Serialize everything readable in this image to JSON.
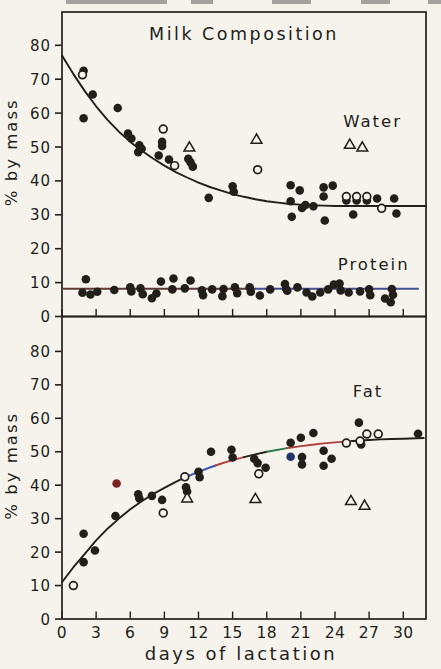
{
  "figure": {
    "title": "Milk Composition",
    "xlabel": "days of lactation",
    "ylabel": "% by mass",
    "colors": {
      "paper": "#f6f3ec",
      "ink": "#221f1b",
      "scan_artifact": "#a3a19d",
      "protein_line_left": "#5d3a35",
      "protein_line_right": "#45508e",
      "fat_fringe_blue": "#3a55b0",
      "fat_fringe_red": "#b04040",
      "fat_fringe_green": "#2e7d4f",
      "special_point_red": "#7a2423",
      "special_point_blue": "#22356e"
    }
  },
  "chart_data": [
    {
      "id": "composition-panel",
      "type": "scatter",
      "title": "Milk Composition",
      "title_pos": [
        16.0,
        81.5
      ],
      "ylabel": "% by mass",
      "xlabel": "",
      "xlim": [
        0,
        32
      ],
      "ylim": [
        0,
        89.5
      ],
      "yticks": [
        0,
        10,
        20,
        30,
        40,
        50,
        60,
        70,
        80
      ],
      "xticks": [
        0,
        3,
        6,
        9,
        12,
        15,
        18,
        21,
        24,
        27,
        30
      ],
      "show_xtick_labels": false,
      "grid": false,
      "legend": "in-plot text labels",
      "series": [
        {
          "name": "Water",
          "label_pos": [
            27.3,
            56.0
          ],
          "marker_filled_circle": [
            [
              1.9,
              72.5
            ],
            [
              2.7,
              65.5
            ],
            [
              1.9,
              58.5
            ],
            [
              4.9,
              61.5
            ],
            [
              5.8,
              54.0
            ],
            [
              6.1,
              52.5
            ],
            [
              6.8,
              50.5
            ],
            [
              6.7,
              48.5
            ],
            [
              7.0,
              49.5
            ],
            [
              8.8,
              51.5
            ],
            [
              8.8,
              50.3
            ],
            [
              8.5,
              47.5
            ],
            [
              9.4,
              46.3
            ],
            [
              11.1,
              46.5
            ],
            [
              11.3,
              45.5
            ],
            [
              11.5,
              44.2
            ],
            [
              12.9,
              35.0
            ],
            [
              15.0,
              38.4
            ],
            [
              15.1,
              36.8
            ],
            [
              20.1,
              38.7
            ],
            [
              20.9,
              37.2
            ],
            [
              20.1,
              34.0
            ],
            [
              20.2,
              29.4
            ],
            [
              21.1,
              32.0
            ],
            [
              21.4,
              32.9
            ],
            [
              22.1,
              32.5
            ],
            [
              23.0,
              38.1
            ],
            [
              23.8,
              38.6
            ],
            [
              23.0,
              35.4
            ],
            [
              23.1,
              28.3
            ],
            [
              25.0,
              34.2
            ],
            [
              25.9,
              34.2
            ],
            [
              26.8,
              34.2
            ],
            [
              25.6,
              30.1
            ],
            [
              27.7,
              34.8
            ],
            [
              29.2,
              34.8
            ],
            [
              29.4,
              30.4
            ]
          ],
          "marker_open_circle": [
            [
              1.8,
              71.3
            ],
            [
              8.9,
              55.3
            ],
            [
              9.9,
              44.5
            ],
            [
              17.2,
              43.3
            ],
            [
              25.0,
              35.4
            ],
            [
              25.9,
              35.4
            ],
            [
              26.8,
              35.4
            ],
            [
              28.1,
              31.9
            ]
          ],
          "marker_open_triangle": [
            [
              11.2,
              50.0
            ],
            [
              17.1,
              52.3
            ],
            [
              25.3,
              50.8
            ],
            [
              26.4,
              50.0
            ]
          ],
          "trend": [
            [
              0,
              77
            ],
            [
              1,
              71.5
            ],
            [
              2,
              66.5
            ],
            [
              3,
              62
            ],
            [
              4,
              58
            ],
            [
              5,
              54.5
            ],
            [
              6,
              51.5
            ],
            [
              7,
              49
            ],
            [
              8,
              46.6
            ],
            [
              9,
              44.5
            ],
            [
              10,
              42.6
            ],
            [
              11,
              41
            ],
            [
              12,
              39.5
            ],
            [
              13,
              38.2
            ],
            [
              14,
              37.1
            ],
            [
              15,
              36.1
            ],
            [
              16,
              35.3
            ],
            [
              17,
              34.6
            ],
            [
              18,
              34.0
            ],
            [
              19,
              33.6
            ],
            [
              20,
              33.2
            ],
            [
              21,
              33.0
            ],
            [
              22,
              32.8
            ],
            [
              23,
              32.7
            ],
            [
              24,
              32.6
            ],
            [
              26,
              32.6
            ],
            [
              28,
              32.6
            ],
            [
              30,
              32.6
            ],
            [
              32,
              32.6
            ]
          ],
          "trend_segments": [
            {
              "from": 0,
              "to": 32,
              "color": "ink"
            }
          ]
        },
        {
          "name": "Protein",
          "label_pos": [
            27.4,
            13.6
          ],
          "marker_filled_circle": [
            [
              2.1,
              11.0
            ],
            [
              1.8,
              7.0
            ],
            [
              2.5,
              6.5
            ],
            [
              3.1,
              7.3
            ],
            [
              4.6,
              7.8
            ],
            [
              6.0,
              8.6
            ],
            [
              6.1,
              7.4
            ],
            [
              6.9,
              8.3
            ],
            [
              7.1,
              6.6
            ],
            [
              7.9,
              5.4
            ],
            [
              8.3,
              6.8
            ],
            [
              8.7,
              10.3
            ],
            [
              9.7,
              8.0
            ],
            [
              9.8,
              11.2
            ],
            [
              10.8,
              8.3
            ],
            [
              11.3,
              10.6
            ],
            [
              12.3,
              7.7
            ],
            [
              12.4,
              6.3
            ],
            [
              13.2,
              8.0
            ],
            [
              14.1,
              6.0
            ],
            [
              14.2,
              8.1
            ],
            [
              15.2,
              8.6
            ],
            [
              15.4,
              6.9
            ],
            [
              16.5,
              8.6
            ],
            [
              16.6,
              7.3
            ],
            [
              17.4,
              6.2
            ],
            [
              18.3,
              8.0
            ],
            [
              19.6,
              9.6
            ],
            [
              19.7,
              8.2
            ],
            [
              19.8,
              7.6
            ],
            [
              20.7,
              8.6
            ],
            [
              21.5,
              7.1
            ],
            [
              22.0,
              5.9
            ],
            [
              22.7,
              7.1
            ],
            [
              23.4,
              8.0
            ],
            [
              23.9,
              9.4
            ],
            [
              24.4,
              9.7
            ],
            [
              24.5,
              7.7
            ],
            [
              25.2,
              7.1
            ],
            [
              26.2,
              7.4
            ],
            [
              27.0,
              8.0
            ],
            [
              27.1,
              6.3
            ],
            [
              28.4,
              5.3
            ],
            [
              28.9,
              4.2
            ],
            [
              29.0,
              8.1
            ],
            [
              29.1,
              6.4
            ]
          ],
          "marker_open_circle": [],
          "marker_open_triangle": [],
          "trend": [
            [
              0,
              8.2
            ],
            [
              31.3,
              8.2
            ]
          ],
          "trend_segments": [
            {
              "from": 0,
              "to": 17,
              "color": "protein_line_left"
            },
            {
              "from": 17,
              "to": 31.3,
              "color": "protein_line_right"
            }
          ]
        }
      ]
    },
    {
      "id": "fat-panel",
      "type": "scatter",
      "title": "",
      "ylabel": "% by mass",
      "xlabel": "days of lactation",
      "xlim": [
        0,
        32
      ],
      "ylim": [
        0,
        90
      ],
      "yticks": [
        0,
        10,
        20,
        30,
        40,
        50,
        60,
        70,
        80
      ],
      "xticks": [
        0,
        3,
        6,
        9,
        12,
        15,
        18,
        21,
        24,
        27,
        30
      ],
      "show_xtick_labels": true,
      "grid": false,
      "legend": "in-plot text labels",
      "series": [
        {
          "name": "Fat",
          "label_pos": [
            26.9,
            66.5
          ],
          "marker_filled_circle": [
            [
              1.9,
              25.5
            ],
            [
              1.9,
              17.0
            ],
            [
              2.9,
              20.5
            ],
            [
              4.7,
              30.8
            ],
            [
              6.7,
              37.3
            ],
            [
              6.8,
              36.0
            ],
            [
              7.9,
              36.8
            ],
            [
              8.8,
              35.6
            ],
            [
              10.9,
              39.4
            ],
            [
              11.0,
              38.1
            ],
            [
              12.0,
              44.0
            ],
            [
              12.1,
              42.4
            ],
            [
              13.1,
              50.0
            ],
            [
              14.9,
              50.6
            ],
            [
              15.0,
              48.3
            ],
            [
              16.9,
              47.9
            ],
            [
              17.2,
              46.6
            ],
            [
              17.9,
              45.2
            ],
            [
              20.1,
              52.7
            ],
            [
              21.0,
              54.2
            ],
            [
              21.1,
              48.4
            ],
            [
              21.1,
              46.2
            ],
            [
              22.1,
              55.6
            ],
            [
              23.0,
              50.3
            ],
            [
              23.0,
              45.8
            ],
            [
              23.7,
              47.9
            ],
            [
              26.1,
              58.7
            ],
            [
              26.3,
              52.2
            ],
            [
              31.3,
              55.4
            ]
          ],
          "marker_filled_circle_red": [
            [
              4.8,
              40.5
            ]
          ],
          "marker_filled_circle_blue": [
            [
              20.1,
              48.5
            ]
          ],
          "marker_open_circle": [
            [
              1.0,
              10.0
            ],
            [
              8.9,
              31.7
            ],
            [
              10.8,
              42.5
            ],
            [
              17.3,
              43.4
            ],
            [
              25.0,
              52.6
            ],
            [
              26.2,
              53.2
            ],
            [
              26.8,
              55.3
            ],
            [
              27.8,
              55.3
            ]
          ],
          "marker_open_triangle": [
            [
              11.0,
              36.2
            ],
            [
              17.0,
              36.0
            ],
            [
              25.4,
              35.4
            ],
            [
              26.6,
              34.0
            ]
          ],
          "trend": [
            [
              0,
              11
            ],
            [
              1,
              15.5
            ],
            [
              2,
              19.5
            ],
            [
              3,
              23.5
            ],
            [
              4,
              27
            ],
            [
              5,
              30
            ],
            [
              6,
              32.8
            ],
            [
              7,
              35.2
            ],
            [
              8,
              37.3
            ],
            [
              9,
              39.2
            ],
            [
              10,
              41
            ],
            [
              11,
              42.6
            ],
            [
              12,
              44
            ],
            [
              13,
              45.3
            ],
            [
              14,
              46.5
            ],
            [
              15,
              47.5
            ],
            [
              16,
              48.4
            ],
            [
              17,
              49.2
            ],
            [
              18,
              50.0
            ],
            [
              19,
              50.6
            ],
            [
              20,
              51.2
            ],
            [
              21,
              51.7
            ],
            [
              22,
              52.1
            ],
            [
              23,
              52.5
            ],
            [
              24,
              52.8
            ],
            [
              25,
              53.1
            ],
            [
              26,
              53.3
            ],
            [
              27,
              53.5
            ],
            [
              28,
              53.7
            ],
            [
              29,
              53.8
            ],
            [
              30,
              53.9
            ],
            [
              31.8,
              54.1
            ]
          ],
          "trend_segments": [
            {
              "from": 0,
              "to": 10.5,
              "color": "ink"
            },
            {
              "from": 10.5,
              "to": 13.5,
              "color": "fat_fringe_blue"
            },
            {
              "from": 13.5,
              "to": 16,
              "color": "fat_fringe_red"
            },
            {
              "from": 16,
              "to": 18,
              "color": "ink"
            },
            {
              "from": 18,
              "to": 19.8,
              "color": "fat_fringe_green"
            },
            {
              "from": 19.8,
              "to": 25.5,
              "color": "fat_fringe_red"
            },
            {
              "from": 25.5,
              "to": 31.8,
              "color": "ink"
            }
          ]
        }
      ]
    }
  ]
}
